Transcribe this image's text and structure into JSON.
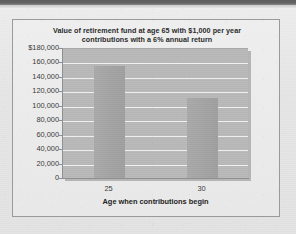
{
  "chart_data": {
    "type": "bar",
    "title": "Value of retirement fund at age 65 with $1,000 per year contributions with a 6% annual return",
    "title_lines": [
      "Value of retirement fund at age 65 with $1,000 per year",
      "contributions with a 6% annual return"
    ],
    "categories": [
      "25",
      "30"
    ],
    "values": [
      154762,
      111435
    ],
    "xlabel": "Age when contributions begin",
    "ylabel": "",
    "ylim": [
      0,
      180000
    ],
    "ytick_values": [
      180000,
      160000,
      140000,
      120000,
      100000,
      80000,
      60000,
      40000,
      20000,
      0
    ],
    "ytick_labels": [
      "$180,000",
      "160,000",
      "140,000",
      "120,000",
      "100,000",
      "80,000",
      "60,000",
      "40,000",
      "20,000",
      "0"
    ],
    "grid": true,
    "legend": false,
    "legend_position": "none",
    "bar_color": "#a4a4a4",
    "plot_background": "#b9b9b9",
    "gridline_color": "#f2f2f2"
  },
  "page": {
    "background_color": "#e7e7e7",
    "frame_border_color": "#9a9a9a",
    "top_band_color": "#5f5f5f"
  }
}
